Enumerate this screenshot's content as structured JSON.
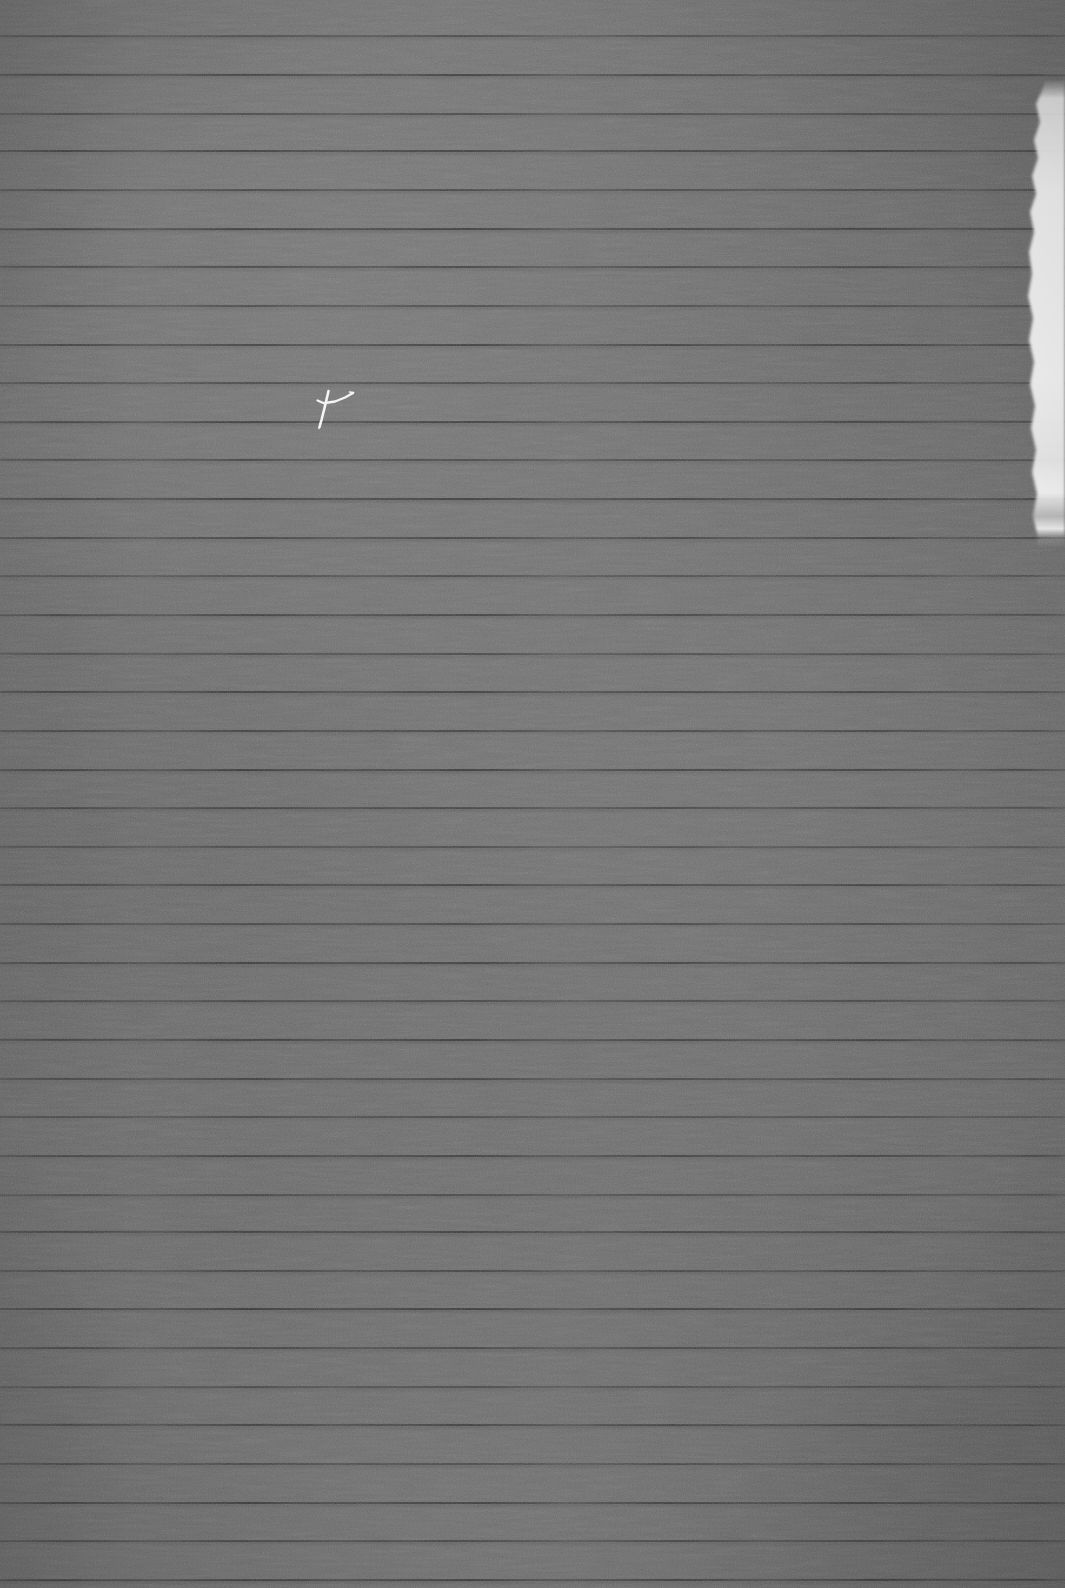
{
  "image": {
    "kind": "photograph-of-ruled-paper",
    "title": "Blank gray ruled notebook paper",
    "width": 1065,
    "height": 1588,
    "description": "A close photographic scan of a blank sheet of ruled (lined) paper rendered in desaturated gray tones. No text or writing is present. A small white scratch-like mark sits in the upper-left quadrant. The right edge shows a ragged bright highlight, like a torn or strongly lit paper border.",
    "content_text": ""
  },
  "colors": {
    "paper_base": "#6c6c6c",
    "paper_light": "#757575",
    "paper_dark": "#606060",
    "rule_line": "#3f3f3f",
    "scratch_white": "#f2f2f2",
    "torn_edge_white": "#e9e9e9",
    "backdrop": "#2b2b2b"
  },
  "ruling": {
    "orientation": "horizontal",
    "line_count": 41,
    "first_line_y": 35,
    "spacing_px": 38.6,
    "line_thickness_px": 2,
    "margin_line_present": false,
    "holes_present": false
  },
  "marks": [
    {
      "name": "white-scratch-mark",
      "shape": "thin cross / gull-wing stroke with trailing swoosh",
      "x": 313,
      "y": 390,
      "width": 40,
      "height": 36,
      "color": "#f2f2f2"
    }
  ],
  "edges": {
    "right_torn_highlight": {
      "name": "torn-right-edge",
      "start_y": 88,
      "end_y": 535,
      "max_width_px": 26,
      "color": "#e9e9e9"
    }
  },
  "overlay": {
    "caption": "",
    "annotations": []
  }
}
